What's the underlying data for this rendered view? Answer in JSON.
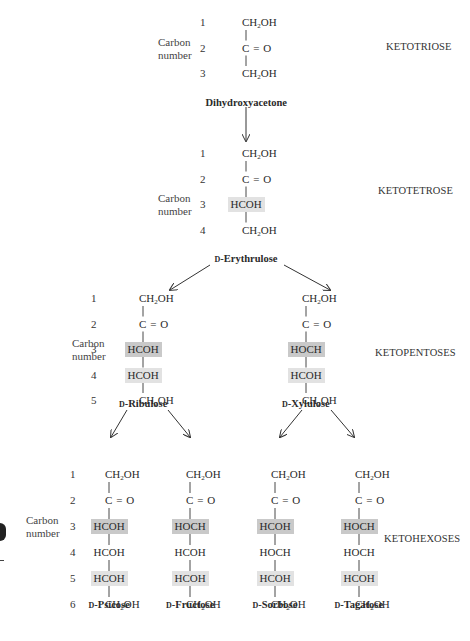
{
  "labels": {
    "carbon_number": [
      "Carbon",
      "number"
    ]
  },
  "classes": [
    "KETOTRIOSE",
    "KETOTETROSE",
    "KETOPENTOSES",
    "KETOHEXOSES"
  ],
  "d_prefix": "D",
  "sugars": [
    {
      "id": "dihydroxyacetone",
      "name_prefix": "",
      "name": "Dihydroxyacetone",
      "groups": [
        {
          "t": "CH2OH",
          "hl": ""
        },
        {
          "t": "C=O",
          "hl": ""
        },
        {
          "t": "CH2OH",
          "hl": ""
        }
      ]
    },
    {
      "id": "erythrulose",
      "name_prefix": "D",
      "name": "-Erythrulose",
      "groups": [
        {
          "t": "CH2OH",
          "hl": ""
        },
        {
          "t": "C=O",
          "hl": ""
        },
        {
          "t": "HCOH",
          "hl": "light"
        },
        {
          "t": "CH2OH",
          "hl": ""
        }
      ]
    },
    {
      "id": "ribulose",
      "name_prefix": "D",
      "name": "-Ribulose",
      "groups": [
        {
          "t": "CH2OH",
          "hl": ""
        },
        {
          "t": "C=O",
          "hl": ""
        },
        {
          "t": "HCOH",
          "hl": "dark"
        },
        {
          "t": "HCOH",
          "hl": "light"
        },
        {
          "t": "CH2OH",
          "hl": ""
        }
      ]
    },
    {
      "id": "xylulose",
      "name_prefix": "D",
      "name": "-Xylulose",
      "groups": [
        {
          "t": "CH2OH",
          "hl": ""
        },
        {
          "t": "C=O",
          "hl": ""
        },
        {
          "t": "HOCH",
          "hl": "dark"
        },
        {
          "t": "HCOH",
          "hl": "light"
        },
        {
          "t": "CH2OH",
          "hl": ""
        }
      ]
    },
    {
      "id": "psicose",
      "name_prefix": "D",
      "name": "-Psicose",
      "groups": [
        {
          "t": "CH2OH",
          "hl": ""
        },
        {
          "t": "C=O",
          "hl": ""
        },
        {
          "t": "HCOH",
          "hl": "dark"
        },
        {
          "t": "HCOH",
          "hl": ""
        },
        {
          "t": "HCOH",
          "hl": "light"
        },
        {
          "t": "CH2OH",
          "hl": ""
        }
      ]
    },
    {
      "id": "fructose",
      "name_prefix": "D",
      "name": "-Fructose",
      "groups": [
        {
          "t": "CH2OH",
          "hl": ""
        },
        {
          "t": "C=O",
          "hl": ""
        },
        {
          "t": "HOCH",
          "hl": "dark"
        },
        {
          "t": "HCOH",
          "hl": ""
        },
        {
          "t": "HCOH",
          "hl": "light"
        },
        {
          "t": "CH2OH",
          "hl": ""
        }
      ]
    },
    {
      "id": "sorbose",
      "name_prefix": "D",
      "name": "-Sorbose",
      "groups": [
        {
          "t": "CH2OH",
          "hl": ""
        },
        {
          "t": "C=O",
          "hl": ""
        },
        {
          "t": "HCOH",
          "hl": "dark"
        },
        {
          "t": "HOCH",
          "hl": ""
        },
        {
          "t": "HCOH",
          "hl": "light"
        },
        {
          "t": "CH2OH",
          "hl": ""
        }
      ]
    },
    {
      "id": "tagatose",
      "name_prefix": "D",
      "name": "-Tagatose",
      "groups": [
        {
          "t": "CH2OH",
          "hl": ""
        },
        {
          "t": "C=O",
          "hl": ""
        },
        {
          "t": "HOCH",
          "hl": "dark"
        },
        {
          "t": "HOCH",
          "hl": ""
        },
        {
          "t": "HCOH",
          "hl": "light"
        },
        {
          "t": "CH2OH",
          "hl": ""
        }
      ]
    }
  ],
  "highlight_colors": {
    "dark": "#c9c9c9",
    "light": "#e2e2e2"
  },
  "arrows": [
    {
      "from": "dihydroxyacetone",
      "to": "erythrulose"
    },
    {
      "from": "erythrulose",
      "to": "ribulose"
    },
    {
      "from": "erythrulose",
      "to": "xylulose"
    },
    {
      "from": "ribulose",
      "to": "psicose"
    },
    {
      "from": "ribulose",
      "to": "fructose"
    },
    {
      "from": "xylulose",
      "to": "sorbose"
    },
    {
      "from": "xylulose",
      "to": "tagatose"
    }
  ]
}
